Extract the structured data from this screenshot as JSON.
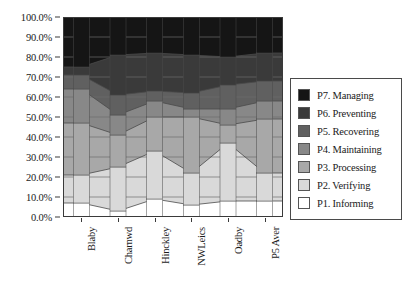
{
  "chart_data": {
    "type": "area",
    "title": "",
    "xlabel": "",
    "ylabel": "",
    "ylim": [
      0,
      100
    ],
    "grid": true,
    "legend_position": "right",
    "categories": [
      "Blaby",
      "Charnwd",
      "Hinckley",
      "NWLeics",
      "Oadby",
      "P5 Aver"
    ],
    "ytick_labels": [
      "100.0%",
      "90.0%",
      "80.0%",
      "70.0%",
      "60.0%",
      "50.0%",
      "40.0%",
      "30.0%",
      "20.0%",
      "10.0%",
      "0.0%"
    ],
    "ytick_values": [
      100,
      90,
      80,
      70,
      60,
      50,
      40,
      30,
      20,
      10,
      0
    ],
    "series": [
      {
        "name": "P1. Informing",
        "color": "#ffffff",
        "values": [
          7,
          3,
          9,
          6,
          8,
          8
        ]
      },
      {
        "name": "P2. Verifying",
        "color": "#d9d9d9",
        "values": [
          14,
          22,
          24,
          16,
          29,
          14
        ]
      },
      {
        "name": "P3. Processing",
        "color": "#a8a8a8",
        "values": [
          26,
          16,
          17,
          28,
          9,
          27
        ]
      },
      {
        "name": "P4. Maintaining",
        "color": "#888888",
        "values": [
          17,
          10,
          8,
          4,
          8,
          9
        ]
      },
      {
        "name": "P5. Recovering",
        "color": "#606060",
        "values": [
          7,
          10,
          5,
          8,
          12,
          10
        ]
      },
      {
        "name": "P6. Preventing",
        "color": "#3a3a3a",
        "values": [
          4,
          20,
          19,
          19,
          14,
          14
        ]
      },
      {
        "name": "P7. Managing",
        "color": "#151515",
        "values": [
          25,
          13,
          18,
          19,
          20,
          18
        ]
      }
    ],
    "cumulative_tops": [
      {
        "name": "P1. Informing",
        "values": [
          7,
          3,
          9,
          6,
          8,
          8
        ]
      },
      {
        "name": "P2. Verifying",
        "values": [
          21,
          25,
          33,
          22,
          37,
          22
        ]
      },
      {
        "name": "P3. Processing",
        "values": [
          47,
          41,
          50,
          50,
          46,
          49
        ]
      },
      {
        "name": "P4. Maintaining",
        "values": [
          64,
          51,
          58,
          54,
          54,
          58
        ]
      },
      {
        "name": "P5. Recovering",
        "values": [
          71,
          61,
          63,
          62,
          66,
          68
        ]
      },
      {
        "name": "P6. Preventing",
        "values": [
          75,
          81,
          82,
          81,
          80,
          82
        ]
      },
      {
        "name": "P7. Managing",
        "values": [
          100,
          100,
          100,
          100,
          100,
          100
        ]
      }
    ]
  },
  "legend": {
    "items": [
      {
        "label": "P7. Managing",
        "color": "#151515"
      },
      {
        "label": "P6. Preventing",
        "color": "#3a3a3a"
      },
      {
        "label": "P5. Recovering",
        "color": "#606060"
      },
      {
        "label": "P4. Maintaining",
        "color": "#888888"
      },
      {
        "label": "P3. Processing",
        "color": "#a8a8a8"
      },
      {
        "label": "P2. Verifying",
        "color": "#d9d9d9"
      },
      {
        "label": "P1. Informing",
        "color": "#ffffff"
      }
    ]
  }
}
